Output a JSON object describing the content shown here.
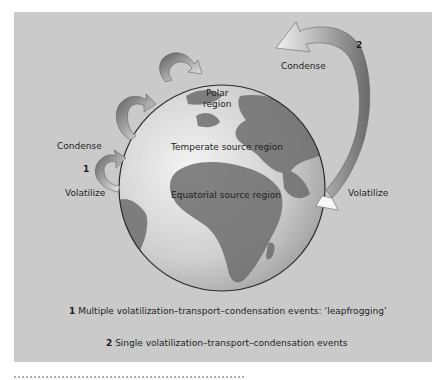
{
  "figure": {
    "panel_color": "#cacaca",
    "globe_labels": {
      "polar_line1": "Polar",
      "polar_line2": "region",
      "temperate": "Temperate source region",
      "equatorial": "Equatorial source region"
    },
    "process_1": {
      "number": "1",
      "condense_label": "Condense",
      "volatilize_label": "Volatilize"
    },
    "process_2": {
      "number": "2",
      "condense_label": "Condense",
      "volatilize_label": "Volatilize"
    },
    "legend": [
      {
        "number": "1",
        "text": "Multiple volatilization–transport–condensation events: ‘leapfrogging’"
      },
      {
        "number": "2",
        "text": "Single volatilization–transport–condensation events"
      }
    ],
    "caption_partial": "Fig. (caption cut off at bottom edge)"
  }
}
